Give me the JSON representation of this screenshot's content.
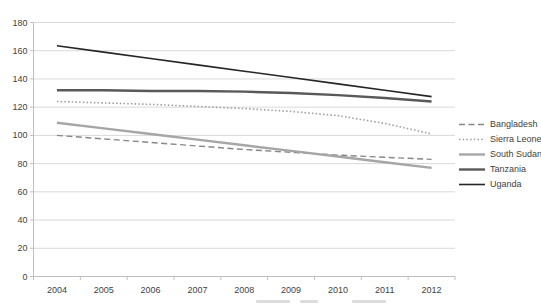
{
  "chart_data": {
    "type": "line",
    "title": "",
    "xlabel": "",
    "ylabel": "",
    "categories": [
      "2004",
      "2005",
      "2006",
      "2007",
      "2008",
      "2009",
      "2010",
      "2011",
      "2012"
    ],
    "y_ticks": [
      0,
      20,
      40,
      60,
      80,
      100,
      120,
      140,
      160,
      180
    ],
    "ylim": [
      0,
      180
    ],
    "grid": true,
    "legend_position": "right",
    "series": [
      {
        "name": "Bangladesh",
        "style": "dashed",
        "color": "#878787",
        "width": 1.4,
        "values": [
          100,
          97.5,
          95,
          92.5,
          90,
          88,
          86,
          84.5,
          83
        ]
      },
      {
        "name": "Sierra Leone",
        "style": "dotted",
        "color": "#9e9e9e",
        "width": 1.6,
        "values": [
          124,
          123,
          122,
          120.5,
          119,
          117,
          114,
          108.5,
          101
        ]
      },
      {
        "name": "South Sudan",
        "style": "solid",
        "color": "#a6a6a6",
        "width": 2.4,
        "values": [
          109,
          105,
          101,
          97,
          93,
          89,
          85,
          81,
          77
        ]
      },
      {
        "name": "Tanzania",
        "style": "solid",
        "color": "#595959",
        "width": 2.4,
        "values": [
          132,
          132,
          131.5,
          131.5,
          131,
          130,
          128.5,
          126.5,
          124
        ]
      },
      {
        "name": "Uganda",
        "style": "solid",
        "color": "#262626",
        "width": 1.6,
        "values": [
          163.5,
          159,
          154.5,
          150,
          145.5,
          141,
          136.5,
          132,
          127.5
        ]
      }
    ],
    "colors": {
      "gridline": "#d9d9d9",
      "axis": "#bfbfbf",
      "tick_label": "#3f3f3f"
    }
  }
}
